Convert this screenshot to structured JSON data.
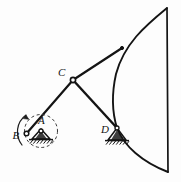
{
  "figure": {
    "type": "engineering-mechanism-diagram",
    "background_color": "#fdfdfd",
    "stroke_color": "#141414"
  },
  "labels": {
    "a": "A",
    "b": "B",
    "c": "C",
    "d": "D"
  },
  "joints": {
    "a": {
      "name": "fixed-pivot-a",
      "x": 41,
      "y": 131,
      "kind": "ground-pin-support",
      "radius": 2.0
    },
    "b": {
      "name": "crank-pin-b",
      "x": 26.5,
      "y": 133.5,
      "kind": "revolute-pin",
      "radius": 2.3
    },
    "c": {
      "name": "coupler-joint-c",
      "x": 73,
      "y": 80,
      "kind": "revolute-pin",
      "radius": 2.6
    },
    "d": {
      "name": "fixed-pivot-d",
      "x": 117,
      "y": 128,
      "kind": "ground-pin-support",
      "radius": 2.0
    },
    "e": {
      "name": "body-attachment-e",
      "x": 122,
      "y": 48,
      "kind": "revolute-pin",
      "radius": 1.6
    }
  },
  "links": [
    {
      "name": "link-b-c",
      "from": "b",
      "to": "c"
    },
    {
      "name": "link-c-e",
      "from": "c",
      "to": "e"
    },
    {
      "name": "link-c-d",
      "from": "c",
      "to": "d"
    }
  ],
  "crank_circle": {
    "name": "crank-path-dashed-circle",
    "cx": 41,
    "cy": 131,
    "r": 16.5,
    "style": "dashed"
  },
  "rotation_arrow": {
    "name": "rotation-direction-arc-arrow",
    "cx": 41,
    "cy": 131,
    "r": 21,
    "start_deg": 205,
    "end_deg": 135,
    "direction": "counterclockwise"
  },
  "sector_body": {
    "name": "curved-sector-body",
    "top_vertex": {
      "x": 167,
      "y": 8
    },
    "bottom_vertex": {
      "x": 168,
      "y": 172
    },
    "right_edge": "straight vertical line",
    "left_edge": "concave arc bulging left through x=113"
  },
  "supports": {
    "a": {
      "name": "pin-support-a",
      "apex_x": 41,
      "apex_y": 129,
      "half_width": 9,
      "base_y": 139,
      "hatch_count": 7
    },
    "d": {
      "name": "pin-support-d",
      "apex_x": 117,
      "apex_y": 128,
      "half_width": 9,
      "base_y": 140,
      "hatch_count": 7
    }
  }
}
